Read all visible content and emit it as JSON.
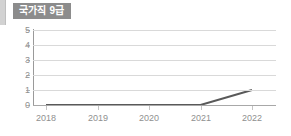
{
  "badge": {
    "label": "국가직 9급",
    "background": "#8c8c8c",
    "text_color": "#ffffff"
  },
  "chart_data": {
    "type": "line",
    "title": "국가직 9급",
    "xlabel": "",
    "ylabel": "",
    "categories": [
      "2018",
      "2019",
      "2020",
      "2021",
      "2022"
    ],
    "x": [
      2018,
      2019,
      2020,
      2021,
      2022
    ],
    "values": [
      0,
      0,
      0,
      0,
      1
    ],
    "series": [
      {
        "name": "국가직 9급",
        "values": [
          0,
          0,
          0,
          0,
          1
        ],
        "color": "#595959"
      }
    ],
    "ylim": [
      0,
      5
    ],
    "yticks": [
      0,
      1,
      2,
      3,
      4,
      5
    ],
    "ytick_labels": [
      "0",
      "1",
      "2",
      "3",
      "4",
      "5"
    ],
    "xtick_labels": [
      "2018",
      "2019",
      "2020",
      "2021",
      "2022"
    ],
    "grid": true,
    "grid_axis": "y",
    "grid_color": "#d9d9d9",
    "legend": false,
    "legend_position": "none",
    "axis_color": "#9a9a9a",
    "tick_label_color": "#8f8f8f",
    "line_color": "#595959",
    "line_width": 2,
    "markers": false,
    "background": "#ffffff"
  }
}
